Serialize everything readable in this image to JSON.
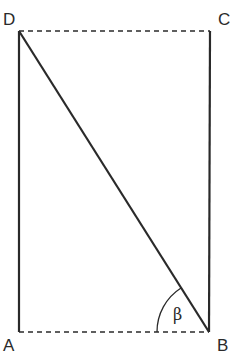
{
  "diagram": {
    "type": "rectangle-with-diagonal",
    "vertices": {
      "A": {
        "label": "A"
      },
      "B": {
        "label": "B"
      },
      "C": {
        "label": "C"
      },
      "D": {
        "label": "D"
      }
    },
    "edges": [
      {
        "from": "D",
        "to": "C",
        "style": "dashed"
      },
      {
        "from": "A",
        "to": "B",
        "style": "dashed"
      },
      {
        "from": "D",
        "to": "A",
        "style": "solid"
      },
      {
        "from": "C",
        "to": "B",
        "style": "solid"
      },
      {
        "from": "D",
        "to": "B",
        "style": "solid"
      }
    ],
    "angle": {
      "label": "β",
      "vertex": "B",
      "between": [
        "BA",
        "BD"
      ]
    },
    "colors": {
      "stroke": "#2a2a2a",
      "background": "#ffffff"
    }
  }
}
